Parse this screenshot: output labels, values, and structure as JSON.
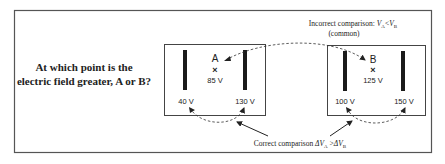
{
  "question": {
    "line1": "At which point is the",
    "line2": "electric field greater, A or B?"
  },
  "incorrect": {
    "prefix": "Incorrect comparison: ",
    "va": "V",
    "va_sub": "A",
    "op": "<",
    "vb": "V",
    "vb_sub": "B",
    "note": "(common)"
  },
  "correct": {
    "prefix": "Correct comparison ",
    "dva": "ΔV",
    "dva_sub": "A",
    "op": " >",
    "dvb": "ΔV",
    "dvb_sub": "B"
  },
  "panel_a": {
    "point_label": "A",
    "point_marker": "×",
    "point_voltage": "85 V",
    "left_plate_voltage": "40 V",
    "right_plate_voltage": "130 V"
  },
  "panel_b": {
    "point_label": "B",
    "point_marker": "×",
    "point_voltage": "125 V",
    "left_plate_voltage": "100 V",
    "right_plate_voltage": "150 V"
  },
  "colors": {
    "ink": "#222222",
    "frame": "#555555",
    "plate": "#1a1a1a"
  }
}
